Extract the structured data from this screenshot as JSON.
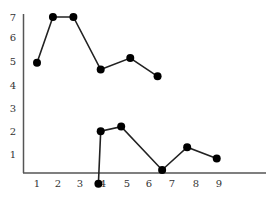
{
  "chart_data": {
    "type": "line",
    "title": "",
    "xlabel": "",
    "ylabel": "",
    "x_ticks": [
      "1",
      "2",
      "3",
      "4",
      "5",
      "6",
      "7",
      "8",
      "9"
    ],
    "y_ticks": [
      "1",
      "2",
      "3",
      "4",
      "5",
      "6",
      "7"
    ],
    "xlim": [
      0.4,
      11.2
    ],
    "ylim": [
      0,
      7.1
    ],
    "grid": false,
    "legend": null,
    "series": [
      {
        "name": "series-1",
        "x": [
          1.0,
          1.7,
          2.6,
          3.8,
          5.1,
          6.3
        ],
        "y": [
          5.0,
          7.0,
          7.0,
          4.7,
          5.2,
          4.4
        ]
      },
      {
        "name": "series-2",
        "x": [
          3.7,
          3.8,
          4.7,
          6.5,
          7.6,
          8.9
        ],
        "y": [
          -0.3,
          2.0,
          2.2,
          0.3,
          1.3,
          0.8
        ]
      }
    ],
    "colors": {
      "line": "#222222",
      "marker": "#000000",
      "axis": "#555555",
      "tick_text": "#333333"
    }
  }
}
